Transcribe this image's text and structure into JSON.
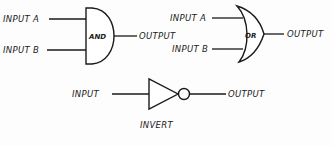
{
  "diagram": {
    "type": "logic-gate-symbols",
    "gates": [
      {
        "id": "and",
        "symbol_label": "AND",
        "inputs": [
          "INPUT A",
          "INPUT B"
        ],
        "output": "OUTPUT"
      },
      {
        "id": "or",
        "symbol_label": "OR",
        "inputs": [
          "INPUT A",
          "INPUT B"
        ],
        "output": "OUTPUT"
      },
      {
        "id": "invert",
        "caption": "INVERT",
        "inputs": [
          "INPUT"
        ],
        "output": "OUTPUT"
      }
    ],
    "colors": {
      "ink": "#1a1a1a",
      "background": "#fdfdfd"
    }
  }
}
